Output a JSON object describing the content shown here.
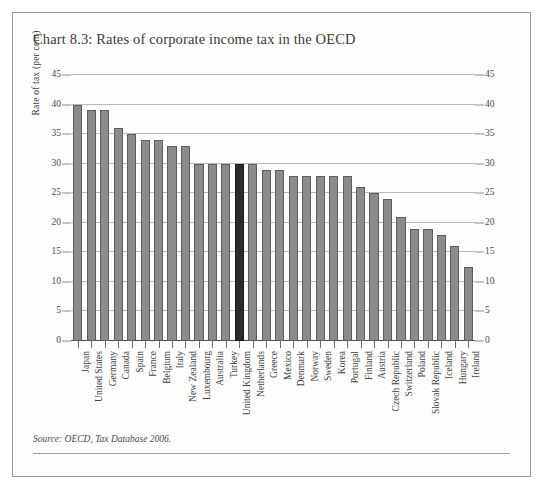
{
  "figure": {
    "title": "Chart 8.3: Rates of corporate income tax in the OECD",
    "source": "Source: OECD, Tax Database 2006.",
    "bar_color": "#8b8b8b",
    "highlight_color": "#2b2b2b",
    "frame_color": "#9a9a9a"
  },
  "chart_data": {
    "type": "bar",
    "title": "Chart 8.3: Rates of corporate income tax in the OECD",
    "xlabel": "",
    "ylabel": "Rate of tax (per cent)",
    "ylim": [
      0,
      45
    ],
    "yticks": [
      0,
      5,
      10,
      15,
      20,
      25,
      30,
      35,
      40,
      45
    ],
    "ytick_labels": [
      "0",
      "5",
      "10",
      "15",
      "20",
      "25",
      "30",
      "35",
      "40",
      "45"
    ],
    "grid": true,
    "legend": false,
    "dual_axis": true,
    "highlight_category": "United Kingdom",
    "categories": [
      "Japan",
      "United States",
      "Germany",
      "Canada",
      "Spain",
      "France",
      "Belgium",
      "Italy",
      "New Zealand",
      "Luxembourg",
      "Australia",
      "Turkey",
      "United Kingdom",
      "Netherlands",
      "Greece",
      "Mexico",
      "Denmark",
      "Norway",
      "Sweden",
      "Korea",
      "Portugal",
      "Finland",
      "Austria",
      "Czech Republic",
      "Switzerland",
      "Poland",
      "Slovak Republic",
      "Iceland",
      "Hungary",
      "Ireland"
    ],
    "values": [
      40,
      39,
      39,
      36,
      35,
      34,
      34,
      33,
      33,
      30,
      30,
      30,
      30,
      30,
      29,
      29,
      28,
      28,
      28,
      28,
      28,
      26,
      25,
      24,
      21,
      19,
      19,
      18,
      16,
      12.5
    ]
  }
}
